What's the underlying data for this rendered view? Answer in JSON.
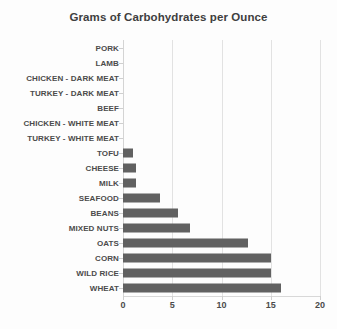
{
  "chart_data": {
    "type": "bar",
    "orientation": "horizontal",
    "title": "Grams of Carbohydrates per Ounce",
    "xlabel": "",
    "ylabel": "",
    "xlim": [
      0,
      20
    ],
    "xticks": [
      0,
      5,
      10,
      15,
      20
    ],
    "xtick_labels": [
      "0",
      "5",
      "10",
      "15",
      "20"
    ],
    "grid": true,
    "grid_axis": "x",
    "legend": false,
    "bar_color": "#616161",
    "categories": [
      "PORK",
      "LAMB",
      "CHICKEN - DARK MEAT",
      "TURKEY - DARK MEAT",
      "BEEF",
      "CHICKEN - WHITE MEAT",
      "TURKEY - WHITE MEAT",
      "TOFU",
      "CHEESE",
      "MILK",
      "SEAFOOD",
      "BEANS",
      "MIXED NUTS",
      "OATS",
      "CORN",
      "WILD RICE",
      "WHEAT"
    ],
    "values": [
      0,
      0,
      0,
      0,
      0,
      0,
      0,
      1,
      1.3,
      1.3,
      3.8,
      5.6,
      6.8,
      12.7,
      15,
      15,
      16
    ]
  }
}
